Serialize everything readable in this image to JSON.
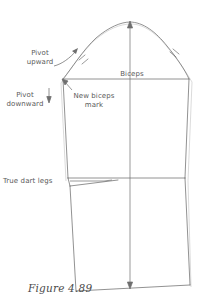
{
  "figure": {
    "caption": "Figure 4.89",
    "background_color": "#ffffff",
    "line_color": "#6b6b6b",
    "guide_color": "#b9b9b9",
    "text_color": "#5a5a5a"
  },
  "labels": {
    "pivot_upward": "Pivot\nupward",
    "pivot_downward": "Pivot\ndownward",
    "new_biceps_mark": "New biceps\nmark",
    "biceps": "Biceps",
    "true_dart_legs": "True dart legs"
  },
  "icons": {
    "pivot_up_arrow": "curved-arrow-up-icon",
    "pivot_down_arrow": "straight-arrow-down-icon",
    "new_biceps_pointer": "leader-arrow-icon",
    "grainline": "double-headed-arrow-icon",
    "dart_leader": "leader-line-icon",
    "cap_notch_marks": "notch-tick-icon"
  },
  "geometry": {
    "cap_top": [
      130,
      22
    ],
    "biceps_line_y": 79,
    "elbow_line_y": 178,
    "left_biceps_point": [
      63,
      79
    ],
    "right_biceps_point": [
      189,
      79
    ],
    "hem_left": [
      76,
      291
    ],
    "hem_right": [
      190,
      285
    ],
    "grainline_top": [
      130,
      22
    ],
    "grainline_bottom": [
      130,
      288
    ]
  }
}
